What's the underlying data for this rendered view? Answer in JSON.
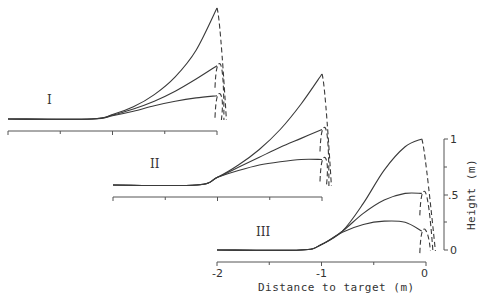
{
  "chart_data": {
    "type": "line",
    "title": "",
    "xlabel": "Distance to target (m)",
    "ylabel": "Height (m)",
    "xlim": [
      -2,
      0
    ],
    "ylim": [
      0,
      1
    ],
    "x_ticks": [
      -2,
      -1.5,
      -1,
      -0.5,
      0
    ],
    "x_tick_labels": [
      "-2",
      "-1",
      "0"
    ],
    "y_tick_labels": [
      "0",
      ".5",
      "1"
    ],
    "y_ticks": [
      0,
      0.25,
      0.5,
      0.75,
      1
    ],
    "grid": false,
    "legend": null,
    "panels": [
      {
        "label": "I",
        "offset_px": [
          0,
          0
        ],
        "series": [
          {
            "name": "high",
            "x": [
              -2,
              -1.2,
              -1.0,
              -0.8,
              -0.6,
              -0.4,
              -0.2,
              0
            ],
            "y": [
              0,
              0,
              0.04,
              0.11,
              0.22,
              0.38,
              0.62,
              1.0
            ]
          },
          {
            "name": "mid",
            "x": [
              -2,
              -1.2,
              -1.0,
              -0.8,
              -0.6,
              -0.4,
              -0.2,
              0
            ],
            "y": [
              0,
              0,
              0.035,
              0.09,
              0.16,
              0.25,
              0.36,
              0.48
            ]
          },
          {
            "name": "low",
            "x": [
              -2,
              -1.2,
              -1.0,
              -0.8,
              -0.6,
              -0.4,
              -0.2,
              0
            ],
            "y": [
              0,
              0,
              0.03,
              0.07,
              0.12,
              0.16,
              0.19,
              0.21
            ]
          }
        ],
        "dashed_fall_end_x": 0.09
      },
      {
        "label": "II",
        "offset_px": [
          105,
          66
        ],
        "series": [
          {
            "name": "high",
            "x": [
              -2,
              -1.2,
              -1.0,
              -0.8,
              -0.6,
              -0.4,
              -0.2,
              0
            ],
            "y": [
              0,
              0,
              0.07,
              0.18,
              0.32,
              0.5,
              0.73,
              1.0
            ]
          },
          {
            "name": "mid",
            "x": [
              -2,
              -1.2,
              -1.0,
              -0.8,
              -0.6,
              -0.4,
              -0.2,
              0
            ],
            "y": [
              0,
              0,
              0.07,
              0.16,
              0.25,
              0.34,
              0.42,
              0.5
            ]
          },
          {
            "name": "low",
            "x": [
              -2,
              -1.2,
              -1.0,
              -0.8,
              -0.6,
              -0.4,
              -0.2,
              0
            ],
            "y": [
              0,
              0,
              0.07,
              0.13,
              0.18,
              0.21,
              0.23,
              0.23
            ]
          }
        ],
        "dashed_fall_end_x": 0.09
      },
      {
        "label": "III",
        "offset_px": [
          209,
          131
        ],
        "series": [
          {
            "name": "high",
            "x": [
              -2,
              -1.2,
              -1.0,
              -0.8,
              -0.6,
              -0.4,
              -0.2,
              -0.04
            ],
            "y": [
              0,
              0,
              0.05,
              0.17,
              0.42,
              0.72,
              0.93,
              1.0
            ]
          },
          {
            "name": "mid",
            "x": [
              -2,
              -1.2,
              -1.0,
              -0.8,
              -0.6,
              -0.4,
              -0.2,
              -0.04
            ],
            "y": [
              0,
              0,
              0.05,
              0.17,
              0.33,
              0.45,
              0.51,
              0.51
            ]
          },
          {
            "name": "low",
            "x": [
              -2,
              -1.2,
              -1.0,
              -0.8,
              -0.6,
              -0.4,
              -0.2,
              -0.04
            ],
            "y": [
              0,
              0,
              0.05,
              0.16,
              0.23,
              0.26,
              0.25,
              0.17
            ]
          }
        ],
        "dashed_fall_end_x": 0.09
      }
    ]
  },
  "labels": {
    "x_axis_title": "Distance to target (m)",
    "y_axis_title": "Height (m)",
    "panel_I": "I",
    "panel_II": "II",
    "panel_III": "III",
    "tick_x_m2": "-2",
    "tick_x_m1": "-1",
    "tick_x_0": "0",
    "tick_y_0": "0",
    "tick_y_05": ".5",
    "tick_y_1": "1"
  }
}
